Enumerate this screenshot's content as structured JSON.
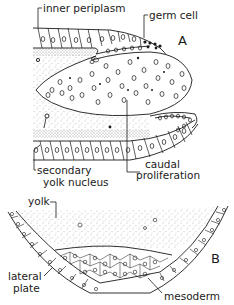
{
  "figure": {
    "panel_a": {
      "letter": "A",
      "labels": {
        "inner_periplasm": "inner periplasm",
        "germ_cell": "germ cell",
        "secondary_yolk_nucleus_1": "secondary",
        "secondary_yolk_nucleus_2": "yolk nucleus",
        "caudal_proliferation_1": "caudal",
        "caudal_proliferation_2": "proliferation"
      }
    },
    "panel_b": {
      "letter": "B",
      "labels": {
        "yolk": "yolk",
        "lateral_plate_1": "lateral",
        "lateral_plate_2": "plate",
        "mesoderm": "mesoderm"
      }
    },
    "colors": {
      "ink": "#1a1a1a",
      "background": "#ffffff",
      "stipple": "#7a7a7a"
    }
  }
}
